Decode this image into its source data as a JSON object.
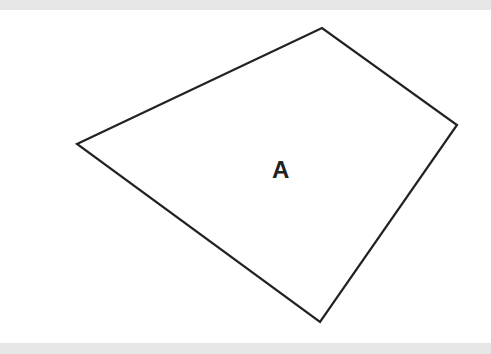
{
  "diagram": {
    "shape": "quadrilateral",
    "label": "A",
    "stroke_color": "#222222",
    "fill_color": "#ffffff",
    "vertices": [
      [
        77,
        144
      ],
      [
        322,
        28
      ],
      [
        457,
        125
      ],
      [
        320,
        322
      ]
    ]
  }
}
